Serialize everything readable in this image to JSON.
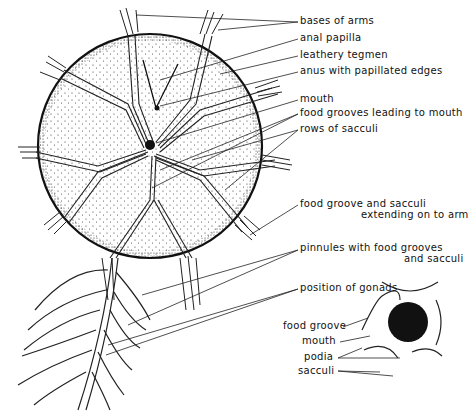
{
  "figure": {
    "labels": [
      {
        "id": "bases-of-arms",
        "text": "bases of arms"
      },
      {
        "id": "anal-papilla",
        "text": "anal papilla"
      },
      {
        "id": "leathery-tegmen",
        "text": "leathery tegmen"
      },
      {
        "id": "anus",
        "text": "anus with papillated edges"
      },
      {
        "id": "mouth",
        "text": "mouth"
      },
      {
        "id": "food-grooves-mouth",
        "text": "food grooves leading to mouth"
      },
      {
        "id": "rows-sacculi",
        "text": "rows of sacculi"
      },
      {
        "id": "food-groove-sacculi-1",
        "text": "food groove and sacculi"
      },
      {
        "id": "food-groove-sacculi-2",
        "text": "extending on to arm"
      },
      {
        "id": "pinnules-1",
        "text": "pinnules with food grooves"
      },
      {
        "id": "pinnules-2",
        "text": "and sacculi"
      },
      {
        "id": "gonads",
        "text": "position of gonads"
      }
    ],
    "inset_labels": [
      {
        "id": "inset-food-groove",
        "text": "food groove"
      },
      {
        "id": "inset-mouth",
        "text": "mouth"
      },
      {
        "id": "inset-podia",
        "text": "podia"
      },
      {
        "id": "inset-sacculi",
        "text": "sacculi"
      }
    ]
  }
}
